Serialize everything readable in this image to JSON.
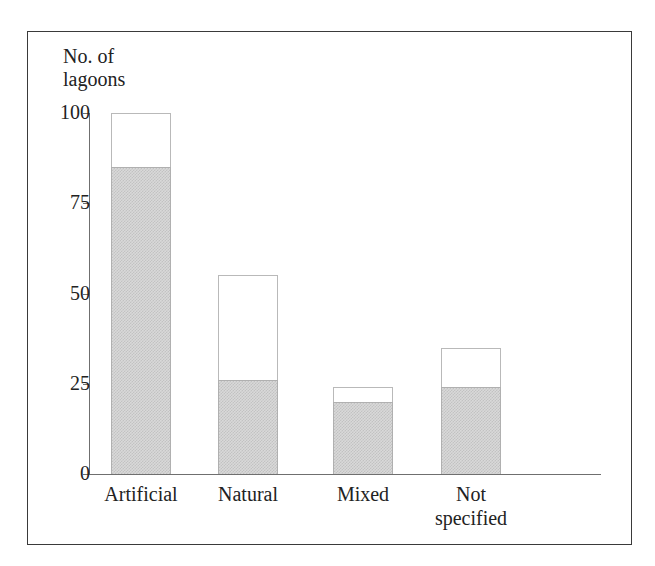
{
  "chart_data": {
    "type": "bar",
    "title": "",
    "ylabel": "No. of\nlagoons",
    "xlabel": "",
    "grid": false,
    "legend": "none",
    "ylim": [
      0,
      100
    ],
    "yticks": [
      "0",
      "25",
      "50",
      "75",
      "100"
    ],
    "ytick_values": [
      0,
      25,
      50,
      75,
      100
    ],
    "categories": [
      "Artificial",
      "Natural",
      "Mixed",
      "Not\nspecified"
    ],
    "series": [
      {
        "name": "shaded",
        "values": [
          85,
          26,
          20,
          24
        ]
      },
      {
        "name": "total",
        "values": [
          100,
          55,
          24,
          35
        ]
      }
    ],
    "bars": [
      {
        "label": "Artificial",
        "filled": 85,
        "total": 100
      },
      {
        "label": "Natural",
        "filled": 26,
        "total": 55
      },
      {
        "label": "Mixed",
        "filled": 20,
        "total": 24
      },
      {
        "label": "Not\nspecified",
        "filled": 24,
        "total": 35
      }
    ],
    "colors": {
      "fill": "#d9d9d9",
      "hatch": "#c2c2c2",
      "outline": "#b0b0b0",
      "axis": "#6f6f6f",
      "frame": "#3a3a3a",
      "text": "#222222",
      "background": "#ffffff"
    }
  }
}
